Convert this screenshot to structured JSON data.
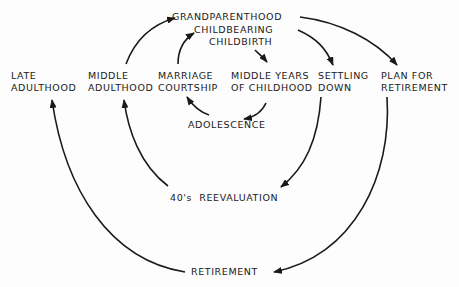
{
  "diagram": {
    "type": "life-cycle flow",
    "nodes": {
      "grandparenthood": "GRANDPARENTHOOD",
      "childbearing": "CHILDBEARING",
      "childbirth": "CHILDBIRTH",
      "late_adulthood": [
        "LATE",
        "ADULTHOOD"
      ],
      "middle_adulthood": [
        "MIDDLE",
        "ADULTHOOD"
      ],
      "marriage_courtship": [
        "MARRIAGE",
        "COURTSHIP"
      ],
      "middle_years": [
        "MIDDLE YEARS",
        "OF CHILDHOOD"
      ],
      "settling_down": [
        "SETTLING",
        "DOWN"
      ],
      "plan_retirement": [
        "PLAN FOR",
        "RETIREMENT"
      ],
      "adolescence": "ADOLESCENCE",
      "reevaluation": "40's  REEVALUATION",
      "retirement": "RETIREMENT"
    },
    "edges": [
      {
        "from": "middle_adulthood",
        "to": "grandparenthood"
      },
      {
        "from": "marriage_courtship",
        "to": "childbearing"
      },
      {
        "from": "childbirth",
        "to": "middle_years"
      },
      {
        "from": "middle_years",
        "to": "adolescence"
      },
      {
        "from": "adolescence",
        "to": "marriage_courtship"
      },
      {
        "from": "childbearing",
        "to": "settling_down"
      },
      {
        "from": "grandparenthood",
        "to": "plan_retirement"
      },
      {
        "from": "settling_down",
        "to": "reevaluation"
      },
      {
        "from": "reevaluation",
        "to": "middle_adulthood"
      },
      {
        "from": "plan_retirement",
        "to": "retirement"
      },
      {
        "from": "retirement",
        "to": "late_adulthood"
      }
    ],
    "colors": {
      "ink": "#1a1a1a",
      "background": "#fdfdfd"
    }
  }
}
